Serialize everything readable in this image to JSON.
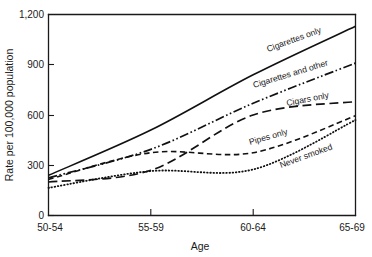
{
  "chart_data": {
    "type": "line",
    "title": "",
    "xlabel": "Age",
    "ylabel": "Rate per 100,000 population",
    "categories": [
      "50-54",
      "55-59",
      "60-64",
      "65-69"
    ],
    "x_tick_labels": [
      "50-54",
      "55-59",
      "60-64",
      "65-69"
    ],
    "y_tick_labels": [
      "0",
      "300",
      "600",
      "900",
      "1,200"
    ],
    "y_tick_values": [
      0,
      300,
      600,
      900,
      1200
    ],
    "ylim": [
      0,
      1200
    ],
    "grid": false,
    "legend_position": "inline-annotations",
    "series": [
      {
        "name": "Cigarettes only",
        "label": "Cigarettes only",
        "style": "solid",
        "values": [
          240,
          510,
          840,
          1130
        ]
      },
      {
        "name": "Cigarettes and other",
        "label": "Cigarettes and other",
        "style": "dash-dot-dot",
        "values": [
          225,
          395,
          670,
          910
        ]
      },
      {
        "name": "Cigars only",
        "label": "Cigars only",
        "style": "long-dash",
        "values": [
          200,
          270,
          600,
          680
        ]
      },
      {
        "name": "Pipes only",
        "label": "Pipes only",
        "style": "dash",
        "values": [
          215,
          375,
          375,
          595
        ]
      },
      {
        "name": "Never smoked",
        "label": "Never smoked",
        "style": "dotted",
        "values": [
          165,
          265,
          275,
          570
        ]
      }
    ],
    "annotations": [
      {
        "text": "Cigarettes only",
        "x": 268,
        "y": 52,
        "rotate": -20
      },
      {
        "text": "Cigarettes and other",
        "x": 258,
        "y": 86,
        "rotate": -17
      },
      {
        "text": "Cigars only",
        "x": 285,
        "y": 105,
        "rotate": -12
      },
      {
        "text": "Pipes only",
        "x": 252,
        "y": 143,
        "rotate": -16
      },
      {
        "text": "Never smoked",
        "x": 283,
        "y": 166,
        "rotate": -20
      }
    ],
    "colors": {
      "ink": "#111111",
      "axis": "#1a1a1a",
      "background": "#ffffff"
    }
  }
}
